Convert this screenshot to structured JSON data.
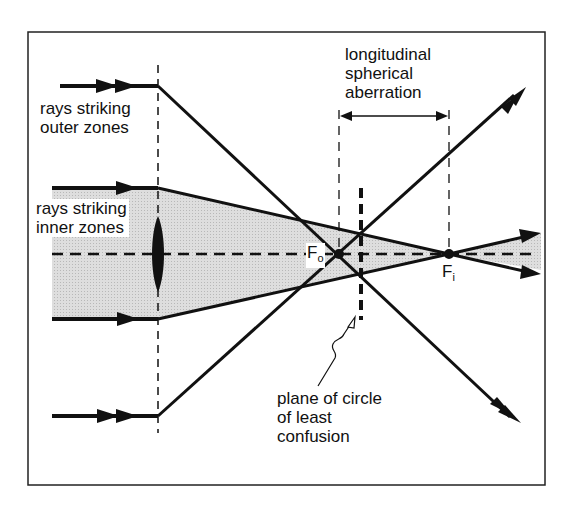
{
  "figure": {
    "labels": {
      "outer_rays_line1": "rays striking",
      "outer_rays_line2": "outer zones",
      "inner_rays_line1": "rays striking",
      "inner_rays_line2": "inner zones",
      "aberration_line1": "longitudinal",
      "aberration_line2": "spherical",
      "aberration_line3": "aberration",
      "focus_outer": "F",
      "focus_outer_sub": "o",
      "focus_inner": "F",
      "focus_inner_sub": "i",
      "plane_line1": "plane of circle",
      "plane_line2": "of least",
      "plane_line3": "confusion"
    },
    "colors": {
      "ink": "#111111",
      "shade": "#d4d4d4",
      "background": "#ffffff"
    }
  }
}
